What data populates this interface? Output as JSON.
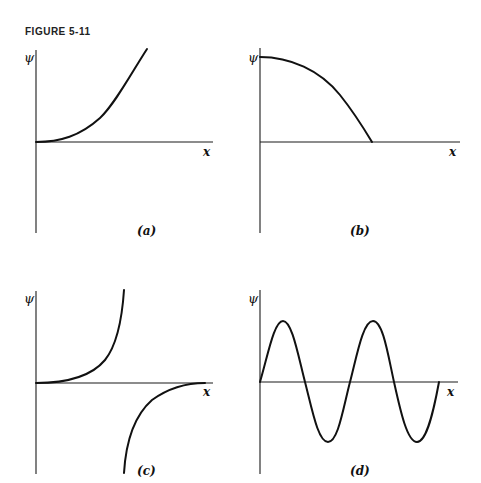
{
  "figure": {
    "title": "FIGURE 5-11",
    "panels": [
      {
        "id": "a",
        "label": "(a)",
        "y_axis_label": "ψ",
        "x_axis_label": "x",
        "description": "curve rising from origin, concave up"
      },
      {
        "id": "b",
        "label": "(b)",
        "y_axis_label": "ψ",
        "x_axis_label": "x",
        "description": "curve starting at max on ψ-axis, concave down, falling to cross x-axis"
      },
      {
        "id": "c",
        "label": "(c)",
        "y_axis_label": "ψ",
        "x_axis_label": "x",
        "description": "upper branch rising steeply from origin; lower branch rising from below, asymptotically approaching x-axis"
      },
      {
        "id": "d",
        "label": "(d)",
        "y_axis_label": "ψ",
        "x_axis_label": "x",
        "description": "sinusoidal oscillation, two full periods starting at origin"
      }
    ]
  },
  "colors": {
    "ink": "#111111",
    "background": "#ffffff"
  }
}
